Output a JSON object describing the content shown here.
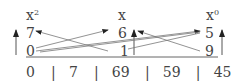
{
  "headers": {
    "left": {
      "base": "x",
      "exp": "2"
    },
    "middle": {
      "base": "x",
      "exp": ""
    },
    "right": {
      "base": "x",
      "exp": "0"
    }
  },
  "columns": {
    "left": {
      "top": "7",
      "bottom": "0"
    },
    "middle": {
      "top": "6",
      "bottom": "1"
    },
    "right": {
      "top": "5",
      "bottom": "9"
    }
  },
  "bottom_row": [
    "0",
    "7",
    "69",
    "59",
    "45"
  ],
  "separator": "|"
}
